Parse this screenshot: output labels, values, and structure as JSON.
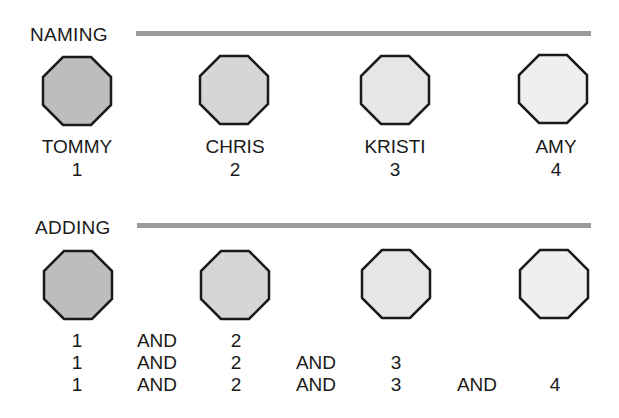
{
  "sections": [
    {
      "heading": "NAMING",
      "children": [
        {
          "name": "TOMMY",
          "number": "1",
          "fill": "#bdbdbd"
        },
        {
          "name": "CHRIS",
          "number": "2",
          "fill": "#d6d6d6"
        },
        {
          "name": "KRISTI",
          "number": "3",
          "fill": "#e6e6e6"
        },
        {
          "name": "AMY",
          "number": "4",
          "fill": "#efefef"
        }
      ]
    },
    {
      "heading": "ADDING",
      "children": [
        {
          "fill": "#bdbdbd"
        },
        {
          "fill": "#d6d6d6"
        },
        {
          "fill": "#e6e6e6"
        },
        {
          "fill": "#efefef"
        }
      ],
      "rows": [
        [
          "1",
          "AND",
          "2",
          "",
          "",
          "",
          ""
        ],
        [
          "1",
          "AND",
          "2",
          "AND",
          "3",
          "",
          ""
        ],
        [
          "1",
          "AND",
          "2",
          "AND",
          "3",
          "AND",
          "4"
        ]
      ]
    }
  ],
  "colors": {
    "bar": "#9a9a9a",
    "outline": "#1a1a1a",
    "text": "#1a1a1a"
  }
}
